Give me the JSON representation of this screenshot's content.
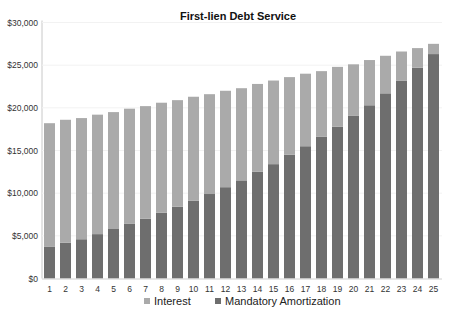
{
  "chart_data": {
    "type": "bar",
    "stacked": true,
    "title": "First-lien Debt Service",
    "xlabel": "",
    "ylabel": "",
    "ylim": [
      0,
      30000
    ],
    "yticks": [
      0,
      5000,
      10000,
      15000,
      20000,
      25000,
      30000
    ],
    "ytick_labels": [
      "$0",
      "$5,000",
      "$10,000",
      "$15,000",
      "$20,000",
      "$25,000",
      "$30,000"
    ],
    "grid": false,
    "legend_position": "bottom",
    "categories": [
      "1",
      "2",
      "3",
      "4",
      "5",
      "6",
      "7",
      "8",
      "9",
      "10",
      "11",
      "12",
      "13",
      "14",
      "15",
      "16",
      "17",
      "18",
      "19",
      "20",
      "21",
      "22",
      "23",
      "24",
      "25"
    ],
    "series": [
      {
        "name": "Mandatory Amortization",
        "color": "#6e6e6e",
        "values": [
          3700,
          4200,
          4600,
          5200,
          5800,
          6400,
          7000,
          7700,
          8400,
          9100,
          9900,
          10700,
          11500,
          12500,
          13400,
          14500,
          15500,
          16600,
          17800,
          19100,
          20300,
          21700,
          23200,
          24700,
          26300
        ]
      },
      {
        "name": "Interest",
        "color": "#aaaaaa",
        "values": [
          14500,
          14400,
          14200,
          14000,
          13700,
          13500,
          13200,
          12900,
          12500,
          12200,
          11700,
          11300,
          10800,
          10300,
          9800,
          9100,
          8500,
          7700,
          7000,
          6000,
          5300,
          4400,
          3400,
          2300,
          1200
        ]
      }
    ],
    "totals": [
      18200,
      18600,
      18800,
      19200,
      19500,
      19900,
      20200,
      20600,
      20900,
      21300,
      21600,
      22000,
      22300,
      22800,
      23200,
      23600,
      24000,
      24300,
      24800,
      25100,
      25600,
      26100,
      26600,
      27000,
      27500
    ]
  },
  "legend": {
    "items": [
      {
        "label": "Interest",
        "color": "#aaaaaa"
      },
      {
        "label": "Mandatory Amortization",
        "color": "#6e6e6e"
      }
    ]
  }
}
